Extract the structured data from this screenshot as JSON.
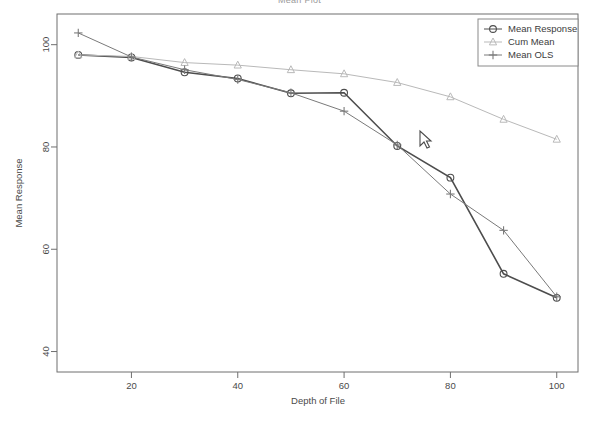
{
  "chart_data": {
    "type": "line",
    "title": "Mean Plot",
    "xlabel": "Depth of File",
    "ylabel": "Mean Response",
    "x": [
      10,
      20,
      30,
      40,
      50,
      60,
      70,
      80,
      90,
      100
    ],
    "xlim": [
      6,
      104
    ],
    "ylim": [
      36,
      106
    ],
    "xticks": [
      20,
      40,
      60,
      80,
      100
    ],
    "yticks": [
      40,
      60,
      80,
      100
    ],
    "grid": false,
    "legend_position": "top-right",
    "series": [
      {
        "name": "Mean Response",
        "marker": "circle",
        "color": "#4d4d4d",
        "values": [
          98.0,
          97.5,
          94.6,
          93.4,
          90.5,
          90.6,
          80.2,
          74.0,
          55.2,
          50.5
        ]
      },
      {
        "name": "Cum Mean",
        "marker": "triangle",
        "color": "#b9b9b9",
        "values": [
          98.0,
          97.7,
          96.5,
          96.0,
          95.1,
          94.3,
          92.6,
          89.8,
          85.4,
          81.5
        ]
      },
      {
        "name": "Mean OLS",
        "marker": "plus",
        "color": "#7a7a7a",
        "values": [
          102.3,
          97.6,
          95.1,
          93.2,
          90.6,
          87.0,
          80.4,
          70.8,
          63.7,
          50.7
        ]
      }
    ]
  },
  "axes": {
    "xlabel": "Depth of File",
    "ylabel": "Mean Response",
    "xticks": [
      "20",
      "40",
      "60",
      "80",
      "100"
    ],
    "yticks": [
      "40",
      "60",
      "80",
      "100"
    ]
  },
  "legend": {
    "items": [
      {
        "label": "Mean Response"
      },
      {
        "label": "Cum Mean"
      },
      {
        "label": "Mean OLS"
      }
    ]
  },
  "cursor": {
    "x": 420,
    "y": 131
  }
}
